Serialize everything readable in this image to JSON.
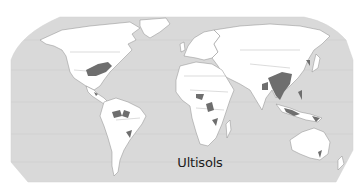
{
  "map": {
    "title": "Ultisols",
    "projection": "Robinson (world)",
    "colors": {
      "ocean": "#d9d9d9",
      "land": "#ffffff",
      "border": "#8c8c8c",
      "graticule": "#c4c4c4",
      "soil_highlight": "#6e6e6e",
      "background": "#ffffff",
      "caption": "#1c1c1c"
    },
    "legend": {
      "highlighted_class": "Ultisols"
    },
    "highlighted_regions": [
      "Southeastern United States",
      "Central America",
      "Northern South America / Amazon basin",
      "Southeastern Brazil",
      "West and Central Africa",
      "Southern Africa",
      "Eastern India",
      "Southern China and Southeast Asia",
      "Indonesia and Philippines",
      "Papua New Guinea",
      "Southeastern Australia",
      "Japan and Korea"
    ]
  }
}
